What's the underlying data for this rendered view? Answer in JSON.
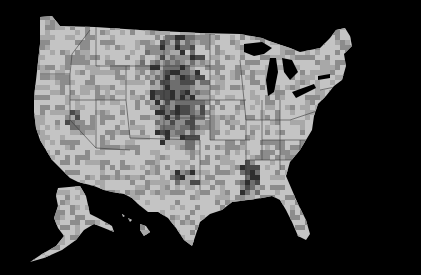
{
  "map": {
    "type": "choropleth",
    "subject": "US counties",
    "background": "#000000",
    "palette": [
      "#c4c4c4",
      "#a8a8a8",
      "#8c8c8c",
      "#6e6e6e",
      "#4a4a4a",
      "#2e2e2e"
    ],
    "border_color": "#3a3a3a",
    "regions": [
      {
        "name": "contiguous-us",
        "outline": "M40,17 L52,16 L60,26 L95,27 L140,30 L200,33 L240,34 L262,38 L272,42 L290,48 L300,52 L320,48 L330,38 L336,30 L345,28 L350,36 L352,46 L344,54 L346,66 L342,80 L334,86 L326,96 L318,104 L314,116 L312,130 L306,140 L300,150 L290,162 L286,176 L292,190 L298,204 L306,220 L310,234 L306,240 L298,236 L292,222 L286,210 L280,200 L272,196 L262,198 L248,200 L232,202 L222,210 L210,214 L200,222 L196,234 L192,246 L184,240 L176,228 L168,218 L158,212 L148,212 L138,204 L132,198 L124,194 L112,192 L104,190 L94,186 L78,182 L70,178 L60,168 L52,160 L46,150 L40,140 L36,128 L34,112 L34,96 L36,80 L38,62 L40,44 Z"
      },
      {
        "name": "alaska",
        "outline": "M58,188 L80,186 L86,196 L90,214 L98,218 L112,226 L114,232 L104,228 L94,224 L84,230 L76,240 L62,250 L44,258 L30,262 L42,254 L56,246 L64,236 L58,228 L54,218 L58,206 L56,196 Z"
      },
      {
        "name": "hawaii",
        "outline": "M140,224 L146,226 L150,232 L144,236 L140,230 Z M128,218 L132,220 L130,222 Z M122,214 L125,216 L123,217 Z"
      }
    ],
    "lakes": [
      {
        "name": "lake-superior",
        "path": "M244,44 L262,42 L272,48 L264,54 L254,56 L244,52 Z"
      },
      {
        "name": "lake-michigan",
        "path": "M270,58 L276,58 L278,72 L274,92 L268,96 L266,80 Z"
      },
      {
        "name": "lake-huron",
        "path": "M282,58 L292,60 L298,72 L290,80 L284,72 Z"
      },
      {
        "name": "lake-erie",
        "path": "M292,92 L314,84 L316,88 L296,98 Z"
      },
      {
        "name": "lake-ontario",
        "path": "M318,76 L330,74 L330,78 L318,80 Z"
      }
    ],
    "dark_clusters": [
      {
        "name": "great-plains",
        "cx": 175,
        "cy": 90,
        "rx": 28,
        "ry": 60,
        "weight": 0.85
      },
      {
        "name": "mississippi-delta",
        "cx": 248,
        "cy": 178,
        "rx": 12,
        "ry": 22,
        "weight": 0.7
      },
      {
        "name": "nevada-west",
        "cx": 72,
        "cy": 118,
        "rx": 8,
        "ry": 12,
        "weight": 0.6
      },
      {
        "name": "texas-central",
        "cx": 182,
        "cy": 172,
        "rx": 16,
        "ry": 12,
        "weight": 0.55
      },
      {
        "name": "montana-east",
        "cx": 150,
        "cy": 52,
        "rx": 18,
        "ry": 12,
        "weight": 0.45
      }
    ],
    "state_borders": [
      "M40,74 L70,74 L70,120 L96,148",
      "M70,74 L72,54 L90,30",
      "M96,27 L96,66 L126,66 L126,100 L70,100",
      "M126,66 L164,66 L164,100",
      "M126,100 L130,138",
      "M96,100 L96,148 L130,150",
      "M164,36 L164,136 L196,136",
      "M164,66 L210,66",
      "M164,100 L214,100",
      "M164,118 L210,118",
      "M130,138 L200,140",
      "M200,140 L200,190",
      "M210,34 L210,140 L250,140",
      "M214,100 L246,100",
      "M240,60 L246,120 L246,180",
      "M246,120 L290,120",
      "M262,100 L262,160",
      "M262,140 L310,140",
      "M280,100 L280,170",
      "M290,120 L320,110",
      "M300,140 L300,190",
      "M246,160 L300,160",
      "M320,90 L340,86",
      "M330,90 L330,110"
    ]
  }
}
